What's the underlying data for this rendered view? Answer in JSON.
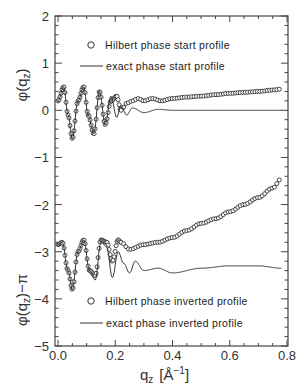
{
  "chart_data": [
    {
      "type": "line",
      "title": "",
      "panel": "upper",
      "xlabel": "q_z [Å^-1]",
      "ylabel": "φ(q_z)",
      "xlim": [
        -0.01,
        0.8
      ],
      "ylim": [
        -5,
        2
      ],
      "legend_position": "upper-center",
      "series": [
        {
          "name": "Hilbert phase start profile",
          "marker": "open-circle",
          "x": [
            0.0,
            0.02,
            0.035,
            0.05,
            0.07,
            0.09,
            0.105,
            0.125,
            0.145,
            0.165,
            0.185,
            0.205,
            0.22,
            0.24,
            0.26,
            0.28,
            0.3,
            0.33,
            0.36,
            0.4,
            0.45,
            0.5,
            0.55,
            0.6,
            0.65,
            0.7,
            0.75,
            0.78
          ],
          "y": [
            0.2,
            0.5,
            -0.1,
            -0.6,
            0.2,
            0.5,
            -0.1,
            -0.5,
            0.4,
            -0.3,
            0.2,
            0.3,
            0.0,
            0.15,
            0.2,
            0.25,
            0.2,
            0.25,
            0.2,
            0.25,
            0.28,
            0.3,
            0.33,
            0.36,
            0.38,
            0.4,
            0.43,
            0.45
          ]
        },
        {
          "name": "exact phase start profile",
          "marker": "line",
          "x": [
            0.0,
            0.02,
            0.035,
            0.05,
            0.07,
            0.09,
            0.105,
            0.125,
            0.145,
            0.165,
            0.185,
            0.205,
            0.22,
            0.24,
            0.26,
            0.3,
            0.35,
            0.4,
            0.5,
            0.6,
            0.7,
            0.78
          ],
          "y": [
            0.2,
            0.5,
            -0.1,
            -0.6,
            0.2,
            0.5,
            -0.1,
            -0.5,
            0.4,
            -0.3,
            0.3,
            -0.15,
            0.1,
            -0.1,
            0.05,
            -0.05,
            0.02,
            0.0,
            0.0,
            0.0,
            0.0,
            0.0
          ]
        }
      ]
    },
    {
      "type": "line",
      "title": "",
      "panel": "lower",
      "xlabel": "q_z [Å^-1]",
      "ylabel": "φ(q_z) − π",
      "xlim": [
        -0.01,
        0.8
      ],
      "ylim": [
        -5,
        2
      ],
      "legend_position": "lower-center",
      "series": [
        {
          "name": "Hilbert phase inverted profile",
          "marker": "open-circle",
          "x": [
            0.0,
            0.015,
            0.035,
            0.05,
            0.07,
            0.09,
            0.11,
            0.13,
            0.15,
            0.17,
            0.19,
            0.21,
            0.22,
            0.25,
            0.3,
            0.35,
            0.4,
            0.45,
            0.5,
            0.55,
            0.6,
            0.65,
            0.7,
            0.75,
            0.78
          ],
          "y": [
            -2.85,
            -2.8,
            -3.4,
            -3.8,
            -3.0,
            -2.75,
            -3.4,
            -3.5,
            -2.75,
            -2.8,
            -3.2,
            -2.75,
            -2.8,
            -2.95,
            -2.85,
            -2.8,
            -2.7,
            -2.55,
            -2.4,
            -2.3,
            -2.15,
            -2.0,
            -1.85,
            -1.65,
            -1.45
          ]
        },
        {
          "name": "exact phase inverted profile",
          "marker": "line",
          "x": [
            0.0,
            0.015,
            0.035,
            0.05,
            0.07,
            0.09,
            0.11,
            0.13,
            0.15,
            0.17,
            0.19,
            0.21,
            0.23,
            0.25,
            0.27,
            0.3,
            0.35,
            0.4,
            0.5,
            0.6,
            0.7,
            0.78
          ],
          "y": [
            -2.85,
            -2.8,
            -3.4,
            -3.8,
            -3.0,
            -2.75,
            -3.4,
            -3.6,
            -2.8,
            -2.9,
            -3.55,
            -3.0,
            -3.25,
            -3.45,
            -3.2,
            -3.4,
            -3.35,
            -3.45,
            -3.35,
            -3.3,
            -3.3,
            -3.35
          ]
        }
      ]
    }
  ],
  "axes": {
    "x_ticks": [
      "0.0",
      "0.2",
      "0.4",
      "0.6",
      "0.8"
    ],
    "x_tick_values": [
      0.0,
      0.2,
      0.4,
      0.6,
      0.8
    ],
    "y_ticks": [
      "2",
      "1",
      "0",
      "−1",
      "−2",
      "−3",
      "−4",
      "−5"
    ],
    "y_tick_values": [
      2,
      1,
      0,
      -1,
      -2,
      -3,
      -4,
      -5
    ],
    "x_title_main": "q",
    "x_title_sub": "z",
    "x_title_unit": "[Å",
    "x_title_unit_exp": "−1",
    "x_title_unit_close": "]",
    "y_title_upper": "φ(q",
    "y_title_upper_sub": "z",
    "y_title_upper_close": ")",
    "y_title_lower": "φ(q",
    "y_title_lower_sub": "z",
    "y_title_lower_close": ")−π"
  },
  "legend_upper": {
    "hilbert_label": "Hilbert phase start profile",
    "exact_label": "exact phase start profile"
  },
  "legend_lower": {
    "hilbert_label": "Hilbert phase inverted profile",
    "exact_label": "exact phase inverted profile"
  },
  "colors": {
    "line": "#333333",
    "marker": "#333333",
    "frame": "#444444"
  }
}
